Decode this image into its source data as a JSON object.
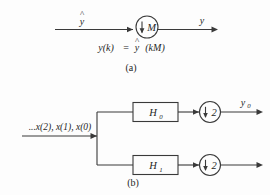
{
  "figure": {
    "ink_color": "#3a3a3a",
    "text_color": "#262626",
    "background": "#fdfdfd"
  },
  "part_a": {
    "caption": "(a)",
    "input_label": "y",
    "input_hat": "^",
    "output_label": "y",
    "downsampler": {
      "arrow_glyph": "↓",
      "factor": "M"
    },
    "equation": {
      "lhs": "y(k)",
      "equals": "=",
      "rhs_base": "y",
      "rhs_hat": "^",
      "rhs_arg": "(kM)",
      "full": "y(k) = ŷ(kM)"
    }
  },
  "part_b": {
    "caption": "(b)",
    "input_label": "...x(2), x(1), x(0)",
    "branches": [
      {
        "filter_label": "H",
        "filter_sub": "0",
        "downsampler_arrow": "↓",
        "downsampler_factor": "2",
        "output_label": "y",
        "output_sub": "0"
      },
      {
        "filter_label": "H",
        "filter_sub": "1",
        "downsampler_arrow": "↓",
        "downsampler_factor": "2",
        "output_label": "",
        "output_sub": ""
      }
    ]
  }
}
